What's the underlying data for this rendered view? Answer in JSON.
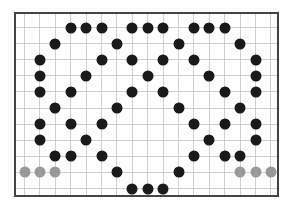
{
  "board": {
    "columns": 17,
    "rows": 11,
    "origin_x": 24,
    "origin_y": 27,
    "col_spacing": 15.4,
    "row_spacing": 16.1,
    "colors": {
      "border": "#444444",
      "grid": "#cfcfcf",
      "black": "#1a1a1a",
      "gray": "#999999"
    }
  },
  "stones": [
    {
      "c": 3,
      "r": 0,
      "color": "black"
    },
    {
      "c": 4,
      "r": 0,
      "color": "black"
    },
    {
      "c": 5,
      "r": 0,
      "color": "black"
    },
    {
      "c": 7,
      "r": 0,
      "color": "black"
    },
    {
      "c": 8,
      "r": 0,
      "color": "black"
    },
    {
      "c": 9,
      "r": 0,
      "color": "black"
    },
    {
      "c": 11,
      "r": 0,
      "color": "black"
    },
    {
      "c": 12,
      "r": 0,
      "color": "black"
    },
    {
      "c": 13,
      "r": 0,
      "color": "black"
    },
    {
      "c": 2,
      "r": 1,
      "color": "black"
    },
    {
      "c": 6,
      "r": 1,
      "color": "black"
    },
    {
      "c": 10,
      "r": 1,
      "color": "black"
    },
    {
      "c": 14,
      "r": 1,
      "color": "black"
    },
    {
      "c": 1,
      "r": 2,
      "color": "black"
    },
    {
      "c": 5,
      "r": 2,
      "color": "black"
    },
    {
      "c": 7,
      "r": 2,
      "color": "black"
    },
    {
      "c": 9,
      "r": 2,
      "color": "black"
    },
    {
      "c": 11,
      "r": 2,
      "color": "black"
    },
    {
      "c": 15,
      "r": 2,
      "color": "black"
    },
    {
      "c": 1,
      "r": 3,
      "color": "black"
    },
    {
      "c": 4,
      "r": 3,
      "color": "black"
    },
    {
      "c": 8,
      "r": 3,
      "color": "black"
    },
    {
      "c": 12,
      "r": 3,
      "color": "black"
    },
    {
      "c": 15,
      "r": 3,
      "color": "black"
    },
    {
      "c": 1,
      "r": 4,
      "color": "black"
    },
    {
      "c": 3,
      "r": 4,
      "color": "black"
    },
    {
      "c": 7,
      "r": 4,
      "color": "black"
    },
    {
      "c": 9,
      "r": 4,
      "color": "black"
    },
    {
      "c": 13,
      "r": 4,
      "color": "black"
    },
    {
      "c": 15,
      "r": 4,
      "color": "black"
    },
    {
      "c": 2,
      "r": 5,
      "color": "black"
    },
    {
      "c": 6,
      "r": 5,
      "color": "black"
    },
    {
      "c": 10,
      "r": 5,
      "color": "black"
    },
    {
      "c": 14,
      "r": 5,
      "color": "black"
    },
    {
      "c": 1,
      "r": 6,
      "color": "black"
    },
    {
      "c": 3,
      "r": 6,
      "color": "black"
    },
    {
      "c": 5,
      "r": 6,
      "color": "black"
    },
    {
      "c": 11,
      "r": 6,
      "color": "black"
    },
    {
      "c": 13,
      "r": 6,
      "color": "black"
    },
    {
      "c": 15,
      "r": 6,
      "color": "black"
    },
    {
      "c": 1,
      "r": 7,
      "color": "black"
    },
    {
      "c": 4,
      "r": 7,
      "color": "black"
    },
    {
      "c": 12,
      "r": 7,
      "color": "black"
    },
    {
      "c": 15,
      "r": 7,
      "color": "black"
    },
    {
      "c": 2,
      "r": 8,
      "color": "black"
    },
    {
      "c": 3,
      "r": 8,
      "color": "black"
    },
    {
      "c": 5,
      "r": 8,
      "color": "black"
    },
    {
      "c": 11,
      "r": 8,
      "color": "black"
    },
    {
      "c": 13,
      "r": 8,
      "color": "black"
    },
    {
      "c": 14,
      "r": 8,
      "color": "black"
    },
    {
      "c": 0,
      "r": 9,
      "color": "gray"
    },
    {
      "c": 1,
      "r": 9,
      "color": "gray"
    },
    {
      "c": 2,
      "r": 9,
      "color": "gray"
    },
    {
      "c": 6,
      "r": 9,
      "color": "black"
    },
    {
      "c": 10,
      "r": 9,
      "color": "black"
    },
    {
      "c": 14,
      "r": 9,
      "color": "gray"
    },
    {
      "c": 15,
      "r": 9,
      "color": "gray"
    },
    {
      "c": 16,
      "r": 9,
      "color": "gray"
    },
    {
      "c": 7,
      "r": 10,
      "color": "black"
    },
    {
      "c": 8,
      "r": 10,
      "color": "black"
    },
    {
      "c": 9,
      "r": 10,
      "color": "black"
    }
  ]
}
